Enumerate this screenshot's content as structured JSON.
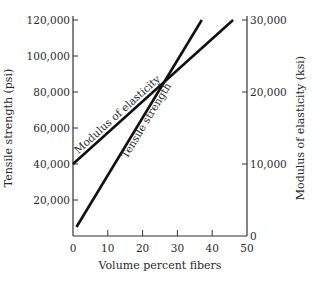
{
  "chart_data": {
    "type": "line",
    "title": "",
    "xlabel": "Volume percent fibers",
    "ylabel": "Tensile strength (psi)",
    "y2label": "Modulus of elasticity (ksi)",
    "xlim": [
      0,
      50
    ],
    "ylim": [
      0,
      120000
    ],
    "y2lim": [
      0,
      30000
    ],
    "grid": false,
    "x_ticks": [
      0,
      10,
      20,
      30,
      40,
      50
    ],
    "x_tick_labels": [
      "0",
      "10",
      "20",
      "30",
      "40",
      "50"
    ],
    "y_ticks": [
      20000,
      40000,
      60000,
      80000,
      100000,
      120000
    ],
    "y_tick_labels": [
      "20,000",
      "40,000",
      "60,000",
      "80,000",
      "100,000",
      "120,000"
    ],
    "y2_ticks": [
      0,
      10000,
      20000,
      30000
    ],
    "y2_tick_labels": [
      "0",
      "10,000",
      "20,000",
      "30,000"
    ],
    "series": [
      {
        "name": "Tensile strength",
        "axis": "left",
        "x": [
          1,
          37
        ],
        "y": [
          5000,
          120000
        ],
        "annotation": "Tensile strength"
      },
      {
        "name": "Modulus of elasticity",
        "axis": "right",
        "x": [
          0,
          46
        ],
        "y": [
          10000,
          30000
        ],
        "annotation": "Modulus of elasticity"
      }
    ]
  }
}
